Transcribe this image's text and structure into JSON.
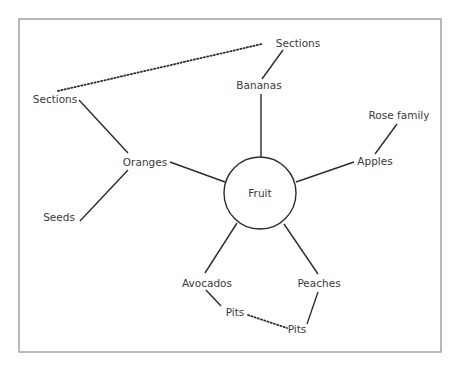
{
  "diagram": {
    "type": "concept-map",
    "center": {
      "label": "Fruit",
      "x": 260,
      "y": 193,
      "r": 36
    },
    "nodes": [
      {
        "id": "sections_top",
        "label": "Sections",
        "x": 298,
        "y": 47
      },
      {
        "id": "bananas",
        "label": "Bananas",
        "x": 259,
        "y": 89
      },
      {
        "id": "sections_left",
        "label": "Sections",
        "x": 55,
        "y": 103
      },
      {
        "id": "rose_family",
        "label": "Rose family",
        "x": 399,
        "y": 119
      },
      {
        "id": "oranges",
        "label": "Oranges",
        "x": 145,
        "y": 166
      },
      {
        "id": "apples",
        "label": "Apples",
        "x": 375,
        "y": 165
      },
      {
        "id": "seeds",
        "label": "Seeds",
        "x": 59,
        "y": 221
      },
      {
        "id": "avocados",
        "label": "Avocados",
        "x": 207,
        "y": 283
      },
      {
        "id": "peaches",
        "label": "Peaches",
        "x": 319,
        "y": 283
      },
      {
        "id": "pits_left",
        "label": "Pits",
        "x": 237,
        "y": 312
      },
      {
        "id": "pits_right",
        "label": "Pits",
        "x": 295,
        "y": 330
      }
    ],
    "edges": [
      {
        "from": "Fruit",
        "to": "Bananas",
        "style": "solid"
      },
      {
        "from": "Bananas",
        "to": "Sections",
        "style": "solid"
      },
      {
        "from": "Fruit",
        "to": "Oranges",
        "style": "solid"
      },
      {
        "from": "Oranges",
        "to": "Sections",
        "style": "solid"
      },
      {
        "from": "Oranges",
        "to": "Seeds",
        "style": "solid"
      },
      {
        "from": "Fruit",
        "to": "Apples",
        "style": "solid"
      },
      {
        "from": "Apples",
        "to": "Rose family",
        "style": "solid"
      },
      {
        "from": "Fruit",
        "to": "Avocados",
        "style": "solid"
      },
      {
        "from": "Avocados",
        "to": "Pits",
        "style": "solid"
      },
      {
        "from": "Fruit",
        "to": "Peaches",
        "style": "solid"
      },
      {
        "from": "Peaches",
        "to": "Pits",
        "style": "solid"
      },
      {
        "from": "Sections (Oranges)",
        "to": "Sections (Bananas)",
        "style": "dotted"
      },
      {
        "from": "Pits (Avocados)",
        "to": "Pits (Peaches)",
        "style": "dotted"
      }
    ]
  },
  "colors": {
    "line": "#2c2c2c",
    "text": "#3a3a3a",
    "frame": "#8a8a8a",
    "background": "#ffffff"
  }
}
